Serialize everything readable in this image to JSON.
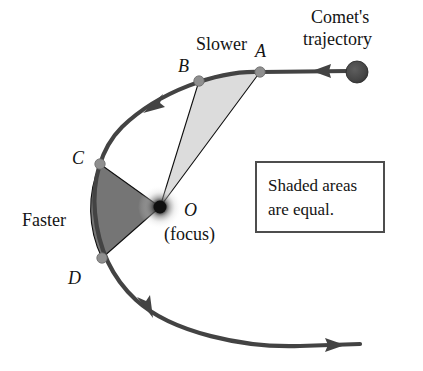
{
  "figure": {
    "title_caption": "Comet's trajectory",
    "labels": {
      "comet_trajectory_line1": "Comet's",
      "comet_trajectory_line2": "trajectory",
      "slower": "Slower",
      "faster": "Faster",
      "point_a": "A",
      "point_b": "B",
      "point_c": "C",
      "point_d": "D",
      "focus_symbol": "O",
      "focus_word": "(focus)"
    },
    "callout": {
      "line1": "Shaded areas",
      "line2": "are equal."
    },
    "colors": {
      "background": "#ffffff",
      "orbit_stroke": "#434343",
      "light_sector_fill": "#dcdcdc",
      "dark_sector_fill": "#757575",
      "node_marker": "#8f8f8f",
      "comet_fill": "#4a4a4a",
      "focus_core": "#111111",
      "text": "#141414",
      "callout_border": "#4d4d4d"
    },
    "geometry": {
      "focus": {
        "x": 160,
        "y": 207
      },
      "points": [
        {
          "name": "A",
          "x": 260,
          "y": 72
        },
        {
          "name": "B",
          "x": 199,
          "y": 81
        },
        {
          "name": "C",
          "x": 100,
          "y": 164
        },
        {
          "name": "D",
          "x": 102,
          "y": 258
        }
      ],
      "comet": {
        "x": 357,
        "y": 72,
        "r": 11
      },
      "callout_box": {
        "x": 256,
        "y": 162,
        "w": 128,
        "h": 70
      },
      "direction_arrows": [
        {
          "name": "inbound-arrow",
          "x": 323,
          "y": 71,
          "points_toward": "left"
        },
        {
          "name": "upper-left-arrow",
          "x": 155,
          "y": 103,
          "points_toward": "lower-left"
        },
        {
          "name": "lower-left-arrow",
          "x": 147,
          "y": 307,
          "points_toward": "lower-right"
        },
        {
          "name": "outbound-arrow",
          "x": 331,
          "y": 345,
          "points_toward": "right"
        }
      ]
    }
  }
}
